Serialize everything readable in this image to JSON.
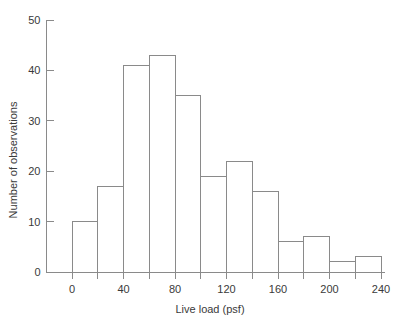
{
  "chart_data": {
    "type": "bar",
    "title": "",
    "subtitle": "",
    "xlabel": "Live load (psf)",
    "ylabel": "Number of observations",
    "xlim": [
      -20,
      250
    ],
    "ylim": [
      0,
      50
    ],
    "grid": false,
    "legend": null,
    "bin_width": 20,
    "bin_edges": [
      0,
      20,
      40,
      60,
      80,
      100,
      120,
      140,
      160,
      180,
      200,
      220,
      240
    ],
    "categories": [
      "0-20",
      "20-40",
      "40-60",
      "60-80",
      "80-100",
      "100-120",
      "120-140",
      "140-160",
      "160-180",
      "180-200",
      "200-220",
      "220-240"
    ],
    "values": [
      10,
      17,
      41,
      43,
      35,
      19,
      22,
      16,
      6,
      7,
      2,
      3
    ],
    "x_ticks": [
      0,
      20,
      40,
      60,
      80,
      100,
      120,
      140,
      160,
      180,
      200,
      220,
      240
    ],
    "x_tick_labels": [
      "0",
      "",
      "40",
      "",
      "80",
      "",
      "120",
      "",
      "160",
      "",
      "200",
      "",
      "240"
    ],
    "x_labeled_ticks": [
      {
        "value": 0,
        "label": "0"
      },
      {
        "value": 40,
        "label": "40"
      },
      {
        "value": 80,
        "label": "80"
      },
      {
        "value": 120,
        "label": "120"
      },
      {
        "value": 160,
        "label": "160"
      },
      {
        "value": 200,
        "label": "200"
      },
      {
        "value": 240,
        "label": "240"
      }
    ],
    "y_ticks": [
      0,
      10,
      20,
      30,
      40,
      50
    ],
    "y_tick_labels": [
      "0",
      "10",
      "20",
      "30",
      "40",
      "50"
    ],
    "colors": {
      "bar_fill": "#ffffff",
      "bar_stroke": "#8a8a8a",
      "axis": "#8a8a8a",
      "text": "#3a3a3a",
      "background": "#ffffff"
    }
  }
}
